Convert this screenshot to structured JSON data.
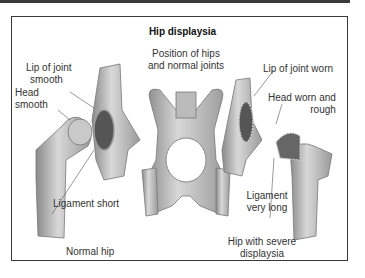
{
  "title": "Hip displaysia",
  "labels": {
    "lip_smooth_1": "Lip of joint",
    "lip_smooth_2": "smooth",
    "head_smooth_1": "Head",
    "head_smooth_2": "smooth",
    "position_1": "Position of hips",
    "position_2": "and normal joints",
    "lip_worn": "Lip of joint worn",
    "head_worn_1": "Head worn and",
    "head_worn_2": "rough",
    "ligament_short": "Ligament short",
    "ligament_long_1": "Ligament",
    "ligament_long_2": "very long",
    "normal_hip": "Normal hip",
    "severe_1": "Hip with severe",
    "severe_2": "displaysia"
  },
  "illustrations": [
    "normal-hip-femur",
    "normal-hip-socket",
    "pelvis-with-hips",
    "dysplastic-socket",
    "dysplastic-femur"
  ]
}
